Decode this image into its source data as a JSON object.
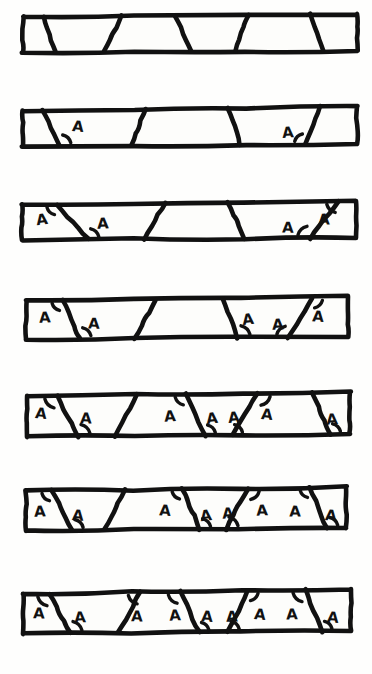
{
  "figure": {
    "title": "Parallel lines cut by transversals — corresponding and related angles marked A",
    "canvas": {
      "width": 372,
      "height": 674,
      "background": "#fefefd"
    },
    "ink_color": "#111111",
    "fill_color": "#fdfdfb",
    "angle_label_text": "A",
    "style": "hand-drawn ink sketch",
    "row_count": 7,
    "rows": [
      {
        "index": 1,
        "name": "row-1-no-angles-marked",
        "top_left": [
          23,
          17
        ],
        "top_right": [
          357,
          14
        ],
        "bottom_right": [
          357,
          51
        ],
        "bottom_left": [
          23,
          52
        ],
        "marked_angle_count": 0,
        "transversal_count": 5,
        "transversals": [
          {
            "top_x": 44,
            "bottom_x": 55
          },
          {
            "top_x": 122,
            "bottom_x": 104
          },
          {
            "top_x": 175,
            "bottom_x": 191
          },
          {
            "top_x": 248,
            "bottom_x": 235
          },
          {
            "top_x": 310,
            "bottom_x": 324
          }
        ],
        "labels": []
      },
      {
        "index": 2,
        "name": "row-2-two-angles-marked",
        "top_left": [
          23,
          111
        ],
        "top_right": [
          357,
          106
        ],
        "bottom_right": [
          357,
          144
        ],
        "bottom_left": [
          23,
          146
        ],
        "marked_angle_count": 2,
        "transversal_count": 4,
        "transversals": [
          {
            "top_x": 42,
            "bottom_x": 60
          },
          {
            "top_x": 146,
            "bottom_x": 131
          },
          {
            "top_x": 228,
            "bottom_x": 240
          },
          {
            "top_x": 320,
            "bottom_x": 305
          }
        ],
        "labels": [
          {
            "x": 78,
            "y": 127,
            "arc_at": "bottom",
            "arc_x": 60,
            "arc_y": 144
          },
          {
            "x": 288,
            "y": 133,
            "arc_at": "bottom",
            "arc_x": 305,
            "arc_y": 144
          }
        ]
      },
      {
        "index": 3,
        "name": "row-3-four-angles-marked",
        "top_left": [
          22,
          205
        ],
        "top_right": [
          356,
          201
        ],
        "bottom_right": [
          356,
          238
        ],
        "bottom_left": [
          22,
          240
        ],
        "marked_angle_count": 4,
        "transversal_count": 4,
        "transversals": [
          {
            "top_x": 57,
            "bottom_x": 88
          },
          {
            "top_x": 165,
            "bottom_x": 145
          },
          {
            "top_x": 228,
            "bottom_x": 245
          },
          {
            "top_x": 338,
            "bottom_x": 310
          }
        ],
        "labels": [
          {
            "x": 42,
            "y": 220,
            "arc_at": "top",
            "arc_x": 57,
            "arc_y": 205
          },
          {
            "x": 103,
            "y": 224,
            "arc_at": "bottom",
            "arc_x": 88,
            "arc_y": 238
          },
          {
            "x": 288,
            "y": 228,
            "arc_at": "bottom",
            "arc_x": 310,
            "arc_y": 238
          },
          {
            "x": 324,
            "y": 220,
            "arc_at": "top",
            "arc_x": 338,
            "arc_y": 201
          }
        ]
      },
      {
        "index": 4,
        "name": "row-4-five-angles-marked",
        "top_left": [
          26,
          301
        ],
        "top_right": [
          348,
          297
        ],
        "bottom_right": [
          348,
          337
        ],
        "bottom_left": [
          26,
          339
        ],
        "marked_angle_count": 5,
        "transversal_count": 4,
        "transversals": [
          {
            "top_x": 62,
            "bottom_x": 80
          },
          {
            "top_x": 155,
            "bottom_x": 135
          },
          {
            "top_x": 222,
            "bottom_x": 238
          },
          {
            "top_x": 312,
            "bottom_x": 288
          }
        ],
        "labels": [
          {
            "x": 45,
            "y": 318,
            "arc_at": "top",
            "arc_x": 62,
            "arc_y": 301
          },
          {
            "x": 94,
            "y": 324,
            "arc_at": "bottom",
            "arc_x": 80,
            "arc_y": 337
          },
          {
            "x": 248,
            "y": 320,
            "arc_at": "bottom",
            "arc_x": 238,
            "arc_y": 337
          },
          {
            "x": 278,
            "y": 325,
            "arc_at": "bottom",
            "arc_x": 288,
            "arc_y": 337
          },
          {
            "x": 318,
            "y": 317,
            "arc_at": "top",
            "arc_x": 312,
            "arc_y": 297
          }
        ]
      },
      {
        "index": 5,
        "name": "row-5-seven-angles-marked",
        "top_left": [
          27,
          396
        ],
        "top_right": [
          350,
          392
        ],
        "bottom_right": [
          350,
          434
        ],
        "bottom_left": [
          27,
          437
        ],
        "marked_angle_count": 7,
        "transversal_count": 5,
        "transversals": [
          {
            "top_x": 57,
            "bottom_x": 78
          },
          {
            "top_x": 137,
            "bottom_x": 115
          },
          {
            "top_x": 186,
            "bottom_x": 205
          },
          {
            "top_x": 258,
            "bottom_x": 232
          },
          {
            "top_x": 312,
            "bottom_x": 330
          }
        ],
        "labels": [
          {
            "x": 41,
            "y": 414,
            "arc_at": "top",
            "arc_x": 57,
            "arc_y": 396
          },
          {
            "x": 86,
            "y": 419,
            "arc_at": "bottom",
            "arc_x": 78,
            "arc_y": 434
          },
          {
            "x": 170,
            "y": 417,
            "arc_at": "top",
            "arc_x": 186,
            "arc_y": 392
          },
          {
            "x": 212,
            "y": 419,
            "arc_at": "bottom",
            "arc_x": 205,
            "arc_y": 434
          },
          {
            "x": 234,
            "y": 418,
            "arc_at": "bottom",
            "arc_x": 232,
            "arc_y": 434
          },
          {
            "x": 267,
            "y": 415,
            "arc_at": "top",
            "arc_x": 258,
            "arc_y": 392
          },
          {
            "x": 332,
            "y": 420,
            "arc_at": "bottom",
            "arc_x": 330,
            "arc_y": 434
          }
        ]
      },
      {
        "index": 6,
        "name": "row-6-eight-angles-marked",
        "top_left": [
          26,
          491
        ],
        "top_right": [
          346,
          487
        ],
        "bottom_right": [
          346,
          528
        ],
        "bottom_left": [
          26,
          531
        ],
        "marked_angle_count": 8,
        "transversal_count": 5,
        "transversals": [
          {
            "top_x": 52,
            "bottom_x": 72
          },
          {
            "top_x": 125,
            "bottom_x": 105
          },
          {
            "top_x": 182,
            "bottom_x": 200
          },
          {
            "top_x": 248,
            "bottom_x": 226
          },
          {
            "top_x": 310,
            "bottom_x": 327
          }
        ],
        "labels": [
          {
            "x": 40,
            "y": 512,
            "arc_at": "top",
            "arc_x": 52,
            "arc_y": 491
          },
          {
            "x": 78,
            "y": 516,
            "arc_at": "bottom",
            "arc_x": 72,
            "arc_y": 528
          },
          {
            "x": 165,
            "y": 511,
            "arc_at": "top",
            "arc_x": 182,
            "arc_y": 487
          },
          {
            "x": 206,
            "y": 516,
            "arc_at": "bottom",
            "arc_x": 200,
            "arc_y": 528
          },
          {
            "x": 228,
            "y": 514,
            "arc_at": "bottom",
            "arc_x": 226,
            "arc_y": 528
          },
          {
            "x": 262,
            "y": 511,
            "arc_at": "top",
            "arc_x": 248,
            "arc_y": 487
          },
          {
            "x": 295,
            "y": 512,
            "arc_at": "top",
            "arc_x": 310,
            "arc_y": 487
          },
          {
            "x": 331,
            "y": 516,
            "arc_at": "bottom",
            "arc_x": 327,
            "arc_y": 528
          }
        ]
      },
      {
        "index": 7,
        "name": "row-7-nine-angles-marked",
        "top_left": [
          23,
          594
        ],
        "top_right": [
          351,
          589
        ],
        "bottom_right": [
          351,
          631
        ],
        "bottom_left": [
          23,
          634
        ],
        "marked_angle_count": 9,
        "transversal_count": 5,
        "transversals": [
          {
            "top_x": 50,
            "bottom_x": 70
          },
          {
            "top_x": 140,
            "bottom_x": 118
          },
          {
            "top_x": 180,
            "bottom_x": 199
          },
          {
            "top_x": 248,
            "bottom_x": 228
          },
          {
            "top_x": 305,
            "bottom_x": 322
          }
        ],
        "labels": [
          {
            "x": 39,
            "y": 614,
            "arc_at": "top",
            "arc_x": 50,
            "arc_y": 594
          },
          {
            "x": 80,
            "y": 618,
            "arc_at": "bottom",
            "arc_x": 70,
            "arc_y": 631
          },
          {
            "x": 137,
            "y": 617,
            "arc_at": "top",
            "arc_x": 140,
            "arc_y": 594
          },
          {
            "x": 175,
            "y": 616,
            "arc_at": "top",
            "arc_x": 180,
            "arc_y": 589
          },
          {
            "x": 207,
            "y": 617,
            "arc_at": "bottom",
            "arc_x": 199,
            "arc_y": 631
          },
          {
            "x": 232,
            "y": 617,
            "arc_at": "bottom",
            "arc_x": 228,
            "arc_y": 631
          },
          {
            "x": 260,
            "y": 615,
            "arc_at": "top",
            "arc_x": 248,
            "arc_y": 589
          },
          {
            "x": 292,
            "y": 615,
            "arc_at": "top",
            "arc_x": 305,
            "arc_y": 589
          },
          {
            "x": 333,
            "y": 618,
            "arc_at": "bottom",
            "arc_x": 322,
            "arc_y": 631
          }
        ]
      }
    ]
  }
}
